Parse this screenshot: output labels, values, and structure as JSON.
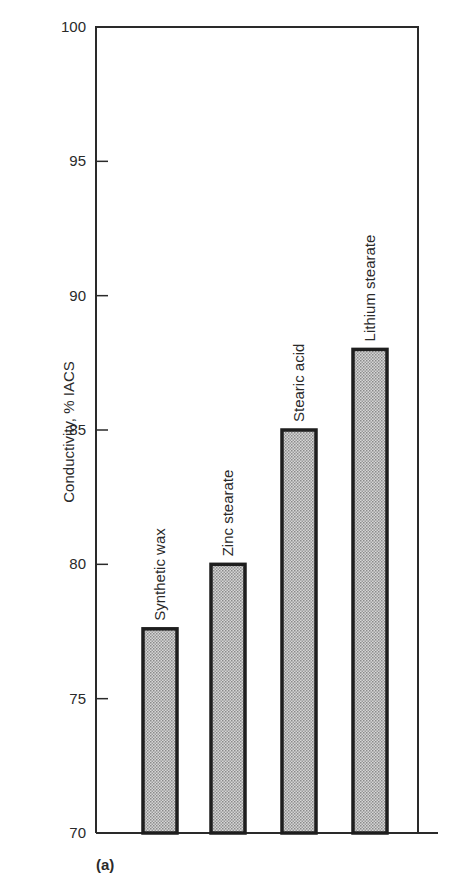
{
  "chart_data": {
    "type": "bar",
    "title": "",
    "panel_label": "(a)",
    "xlabel": "",
    "ylabel": "Conductivity, % IACS",
    "ylim": [
      70,
      100
    ],
    "yticks": [
      70,
      75,
      80,
      85,
      90,
      95,
      100
    ],
    "grid": false,
    "legend": null,
    "categories": [
      "Synthetic wax",
      "Zinc stearate",
      "Stearic acid",
      "Lithium stearate"
    ],
    "values": [
      77.6,
      80.0,
      85.0,
      88.0
    ],
    "bar_labels_rotated": true,
    "bar_fill": "stippled gray",
    "colors": {
      "bar_fill": "#bdbdbd",
      "bar_edge": "#1e1e1e",
      "axis": "#2a2a2a"
    }
  }
}
